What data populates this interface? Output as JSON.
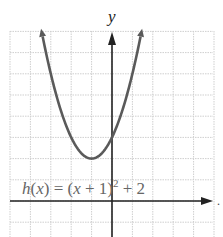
{
  "chart_data": {
    "type": "line",
    "title": "",
    "function_label": "h(x) = (x + 1)^2 + 2",
    "xlabel": "x",
    "ylabel": "y",
    "xlim": [
      -5,
      5
    ],
    "ylim": [
      -2,
      8
    ],
    "grid": true,
    "vertex": [
      -1,
      2
    ],
    "y_intercept": [
      0,
      3
    ],
    "series": [
      {
        "name": "h(x) = (x + 1)^2 + 2",
        "x": [
          -3.45,
          -3,
          -2.5,
          -2,
          -1.5,
          -1,
          -0.5,
          0,
          0.5,
          1,
          1.45
        ],
        "y": [
          8,
          6,
          4.25,
          3,
          2.25,
          2,
          2.25,
          3,
          4.25,
          6,
          8
        ]
      }
    ]
  },
  "labels": {
    "y_axis": "y",
    "eq_h": "h",
    "eq_rest_a": "(",
    "eq_x": "x",
    "eq_rest_b": ") = (",
    "eq_x2": "x",
    "eq_rest_c": " + 1)",
    "eq_exp": "2",
    "eq_rest_d": " + 2",
    "x_axis_dot": "."
  },
  "colors": {
    "curve": "#5a5a5a",
    "axis": "#222222",
    "grid": "#c8c8c8",
    "text": "#555555"
  }
}
